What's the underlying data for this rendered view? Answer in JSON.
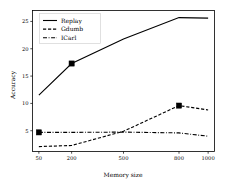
{
  "chart_data": {
    "type": "line",
    "title": "",
    "xlabel": "Memory size",
    "ylabel": "Accuracy",
    "x": [
      50,
      200,
      500,
      800,
      1000
    ],
    "xtick_labels": [
      "50",
      "200",
      "500",
      "800",
      "1000"
    ],
    "ytick_labels": [
      "5",
      "10",
      "15",
      "20",
      "25"
    ],
    "yticks": [
      5,
      10,
      15,
      20,
      25
    ],
    "ylim": [
      1.2,
      27.0
    ],
    "xlim": [
      50,
      1000
    ],
    "grid": false,
    "legend_position": "upper left",
    "series": [
      {
        "name": "Replay",
        "style": "solid",
        "values": [
          11.5,
          17.3,
          21.8,
          25.7,
          25.6
        ],
        "markers_at": [
          200
        ]
      },
      {
        "name": "Gdumb",
        "style": "dashed",
        "values": [
          2.1,
          2.3,
          4.9,
          9.6,
          8.8
        ],
        "markers_at": [
          800
        ]
      },
      {
        "name": "ICarl",
        "style": "dashdot",
        "values": [
          4.7,
          4.7,
          4.75,
          4.6,
          4.0
        ],
        "markers_at": [
          50
        ]
      }
    ]
  },
  "legend": {
    "entries": [
      {
        "label": "Replay"
      },
      {
        "label": "Gdumb"
      },
      {
        "label": "ICarl"
      }
    ]
  },
  "axes": {
    "x_title": "Memory size",
    "y_title": "Accuracy",
    "x_ticks": [
      "50",
      "200",
      "500",
      "800",
      "1000"
    ],
    "y_ticks": [
      "5",
      "10",
      "15",
      "20",
      "25"
    ]
  }
}
